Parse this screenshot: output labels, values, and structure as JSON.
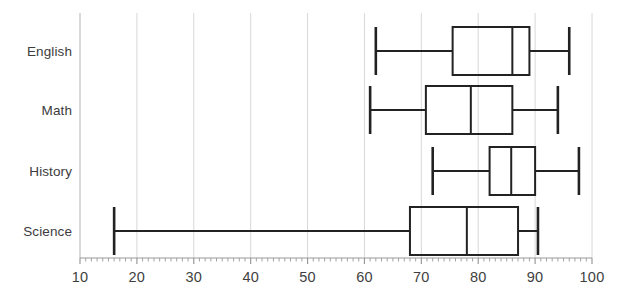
{
  "chart_data": {
    "type": "box",
    "title": "",
    "xlabel": "",
    "ylabel": "",
    "orientation": "horizontal",
    "xlim": [
      10,
      100
    ],
    "xticks": [
      10,
      20,
      30,
      40,
      50,
      60,
      70,
      80,
      90,
      100
    ],
    "xtick_labels": [
      "10",
      "20",
      "30",
      "40",
      "50",
      "60",
      "70",
      "80",
      "90",
      "100"
    ],
    "minor_ticks": true,
    "grid": "vertical",
    "grid_color": "#d8d8d8",
    "axis_color": "#c9c9c9",
    "box_color": "#222222",
    "categories": [
      "English",
      "Math",
      "History",
      "Science"
    ],
    "boxes": [
      {
        "category": "English",
        "whisker_low": 62,
        "q1": 75.5,
        "median": 86,
        "q3": 89,
        "whisker_high": 96
      },
      {
        "category": "Math",
        "whisker_low": 61,
        "q1": 70.8,
        "median": 78.7,
        "q3": 86,
        "whisker_high": 94
      },
      {
        "category": "History",
        "whisker_low": 72,
        "q1": 82,
        "median": 85.8,
        "q3": 90,
        "whisker_high": 97.7
      },
      {
        "category": "Science",
        "whisker_low": 16,
        "q1": 68,
        "median": 78,
        "q3": 87,
        "whisker_high": 90.5
      }
    ]
  },
  "layout": {
    "plot_left": 80,
    "plot_right": 592,
    "plot_top": 13,
    "plot_bottom": 258,
    "row_centers": [
      51,
      110,
      171,
      231
    ],
    "box_half_height": 24,
    "cap_half_height": 24,
    "label_x_right": 72
  }
}
